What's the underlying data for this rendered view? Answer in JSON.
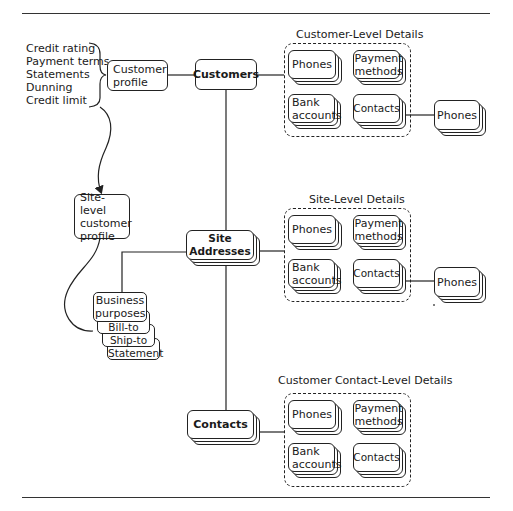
{
  "diagram": {
    "profile_attributes": [
      "Credit rating",
      "Payment terms",
      "Statements",
      "Dunning",
      "Credit limit"
    ],
    "customer_profile": "Customer profile",
    "customers": "Customers",
    "site_level_customer_profile": "Site-level customer profile",
    "site_addresses": "Site Addresses",
    "contacts": "Contacts",
    "business_purposes": {
      "title": "Business purposes",
      "items": [
        "Bill-to",
        "Ship-to",
        "Statement"
      ]
    },
    "groups": [
      {
        "title": "Customer-Level Details",
        "items": [
          "Phones",
          "Payment methods",
          "Bank accounts",
          "Contacts"
        ],
        "external": "Phones"
      },
      {
        "title": "Site-Level Details",
        "items": [
          "Phones",
          "Payment methods",
          "Bank accounts",
          "Contacts"
        ],
        "external": "Phones"
      },
      {
        "title": "Customer Contact-Level Details",
        "items": [
          "Phones",
          "Payment methods",
          "Bank accounts",
          "Contacts"
        ]
      }
    ]
  }
}
